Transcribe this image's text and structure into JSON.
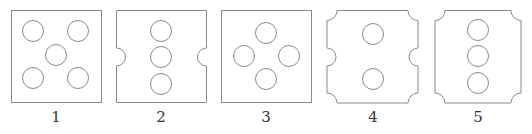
{
  "figure": {
    "type": "pattern-options",
    "stroke_color": "#8a8a8a",
    "options": [
      {
        "label": "1",
        "description": "square with five circles (dice-five pattern)",
        "holes": 5,
        "notches": "none"
      },
      {
        "label": "2",
        "description": "square with three vertical circles and semicircular notches on left and right sides",
        "holes": 3,
        "notches": "side-semicircles"
      },
      {
        "label": "3",
        "description": "square with four circles in diamond arrangement",
        "holes": 4,
        "notches": "none"
      },
      {
        "label": "4",
        "description": "square with two vertical circles, concave corner cuts and side semicircular notches",
        "holes": 2,
        "notches": "corners-and-sides"
      },
      {
        "label": "5",
        "description": "square with three vertical circles and concave corner cuts",
        "holes": 3,
        "notches": "corners"
      }
    ]
  }
}
